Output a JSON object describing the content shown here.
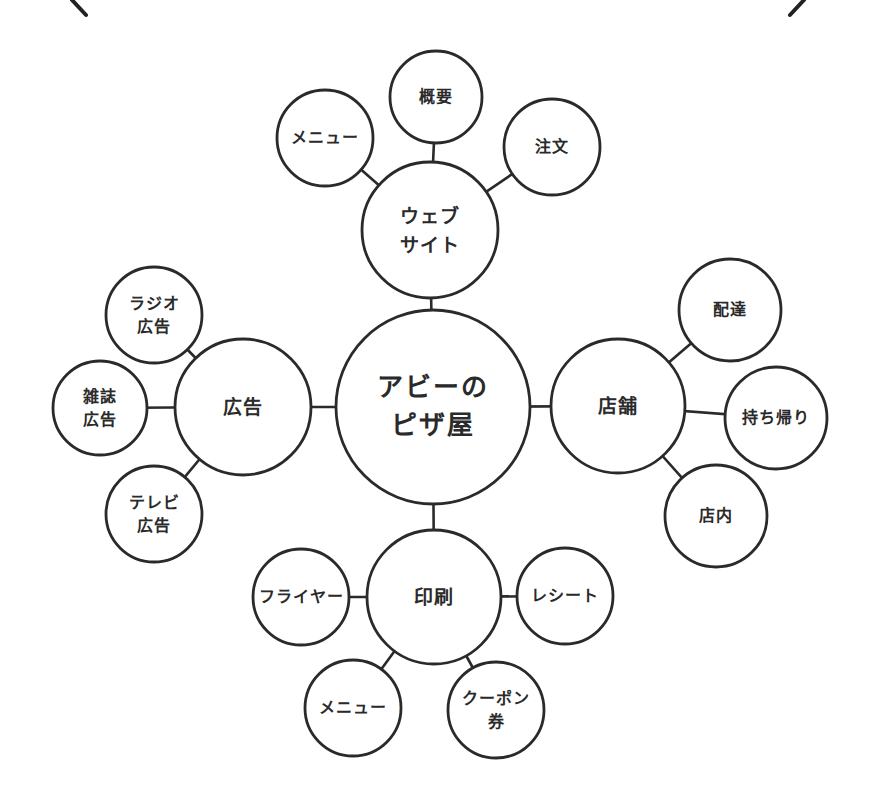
{
  "diagram": {
    "type": "mind-map",
    "style": {
      "stroke": "#2a2a2a",
      "fill": "#ffffff",
      "background": "#ffffff"
    },
    "brackets": [
      {
        "name": "left-bracket-stroke",
        "x1": 72,
        "y1": 0,
        "x2": 86,
        "y2": 15
      },
      {
        "name": "right-bracket-stroke",
        "x1": 804,
        "y1": 0,
        "x2": 790,
        "y2": 15
      }
    ],
    "nodes": [
      {
        "id": "root",
        "label": "アビーの\nピザ屋",
        "level": "root",
        "cx": 433,
        "cy": 407,
        "r": 97
      },
      {
        "id": "website",
        "label": "ウェブ\nサイト",
        "level": "branch",
        "parent": "root",
        "cx": 430,
        "cy": 230,
        "r": 68
      },
      {
        "id": "website-overview",
        "label": "概要",
        "level": "leaf",
        "parent": "website",
        "cx": 436,
        "cy": 97,
        "r": 46
      },
      {
        "id": "website-menu",
        "label": "メニュー",
        "level": "leaf",
        "parent": "website",
        "cx": 325,
        "cy": 138,
        "r": 48
      },
      {
        "id": "website-order",
        "label": "注文",
        "level": "leaf",
        "parent": "website",
        "cx": 552,
        "cy": 147,
        "r": 48
      },
      {
        "id": "advertising",
        "label": "広告",
        "level": "branch",
        "parent": "root",
        "cx": 243,
        "cy": 407,
        "r": 68
      },
      {
        "id": "ad-radio",
        "label": "ラジオ\n広告",
        "level": "leaf",
        "parent": "advertising",
        "cx": 154,
        "cy": 315,
        "r": 48
      },
      {
        "id": "ad-magazine",
        "label": "雑誌\n広告",
        "level": "leaf",
        "parent": "advertising",
        "cx": 100,
        "cy": 408,
        "r": 47
      },
      {
        "id": "ad-tv",
        "label": "テレビ\n広告",
        "level": "leaf",
        "parent": "advertising",
        "cx": 154,
        "cy": 514,
        "r": 48
      },
      {
        "id": "store",
        "label": "店舗",
        "level": "branch",
        "parent": "root",
        "cx": 618,
        "cy": 406,
        "r": 67
      },
      {
        "id": "store-delivery",
        "label": "配達",
        "level": "leaf",
        "parent": "store",
        "cx": 730,
        "cy": 310,
        "r": 51
      },
      {
        "id": "store-takeout",
        "label": "持ち帰り",
        "level": "leaf",
        "parent": "store",
        "cx": 776,
        "cy": 418,
        "r": 51
      },
      {
        "id": "store-dinein",
        "label": "店内",
        "level": "leaf",
        "parent": "store",
        "cx": 716,
        "cy": 516,
        "r": 51
      },
      {
        "id": "print",
        "label": "印刷",
        "level": "branch",
        "parent": "root",
        "cx": 434,
        "cy": 597,
        "r": 67
      },
      {
        "id": "print-flyer",
        "label": "フライヤー",
        "level": "leaf",
        "parent": "print",
        "cx": 301,
        "cy": 597,
        "r": 48
      },
      {
        "id": "print-receipt",
        "label": "レシート",
        "level": "leaf",
        "parent": "print",
        "cx": 565,
        "cy": 596,
        "r": 48
      },
      {
        "id": "print-menu",
        "label": "メニュー",
        "level": "leaf",
        "parent": "print",
        "cx": 353,
        "cy": 708,
        "r": 48
      },
      {
        "id": "print-coupon",
        "label": "クーポン\n券",
        "level": "leaf",
        "parent": "print",
        "cx": 496,
        "cy": 710,
        "r": 48
      }
    ]
  }
}
